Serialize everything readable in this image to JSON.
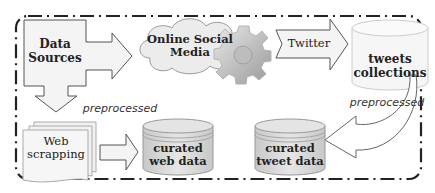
{
  "diagram": {
    "nodes": {
      "data_sources": {
        "label_line1": "Data",
        "label_line2": "Sources",
        "shape": "box-arrow"
      },
      "online_social_media": {
        "label_line1": "Online Social",
        "label_line2": "Media",
        "shape": "cloud",
        "icon": "gear-icon"
      },
      "twitter": {
        "label": "Twitter",
        "shape": "arrow"
      },
      "tweets_collections": {
        "label_line1": "tweets",
        "label_line2": "collections",
        "shape": "cylinder"
      },
      "web_scrapping": {
        "label_line1": "Web",
        "label_line2": "scrapping",
        "shape": "document-stack"
      },
      "curated_web_data": {
        "label_line1": "curated",
        "label_line2": "web data",
        "shape": "database"
      },
      "curated_tweet_data": {
        "label_line1": "curated",
        "label_line2": "tweet data",
        "shape": "database"
      }
    },
    "edge_labels": {
      "web_preprocessed": "preprocessed",
      "tweet_preprocessed": "preprocessed"
    },
    "colors": {
      "stroke": "#555555",
      "fill_light": "#f2f2f2",
      "fill_db": "#d9d9d9",
      "border": "#222222"
    }
  }
}
